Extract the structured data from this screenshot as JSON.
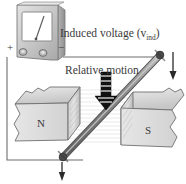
{
  "figure": {
    "title_text": "Induced voltage (v",
    "subscript": "ind",
    "title_close": ")",
    "motion_label": "Relative motion",
    "background_color": "#ffffff"
  },
  "meter": {
    "name": "voltmeter",
    "body_color": "#c9c9c9",
    "face_color": "#ffffff",
    "needle_color": "#555555",
    "plus_label": "+",
    "minus_label": "−",
    "terminal_count": 2
  },
  "magnets": [
    {
      "pole_label": "N",
      "side": "left",
      "face_color": "#dcdcdc",
      "top_color": "#cfcfcf",
      "front_color": "#e2e2e2"
    },
    {
      "pole_label": "S",
      "side": "right",
      "face_color": "#dcdcdc",
      "top_color": "#cfcfcf",
      "front_color": "#e2e2e2"
    }
  ],
  "rod": {
    "name": "conducting-rod",
    "color": "#8f8f8f",
    "tip_color": "#4a4a4a",
    "orientation": "diagonal"
  },
  "arrows": {
    "motion_arrow": "striped-down-arrow",
    "rod_top_arrow": "down-arrow",
    "rod_bottom_arrow": "down-arrow"
  },
  "wire": {
    "color": "#6d6d6d",
    "description": "circuit-loop"
  },
  "field_lines": {
    "count": 14,
    "color": "#d8d8d8"
  }
}
